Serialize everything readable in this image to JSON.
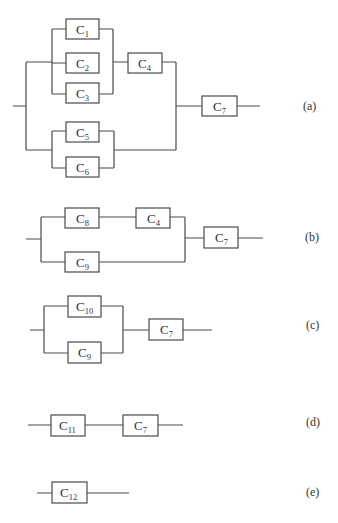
{
  "diagram": {
    "type": "reliability-block-diagram-reduction",
    "colors": {
      "line": "#4a4a4a",
      "text": "#333333",
      "background": "#ffffff"
    },
    "subfigures": [
      {
        "id": "a",
        "label": "(a)",
        "components": [
          {
            "name": "C",
            "sub": "1"
          },
          {
            "name": "C",
            "sub": "2"
          },
          {
            "name": "C",
            "sub": "3"
          },
          {
            "name": "C",
            "sub": "4"
          },
          {
            "name": "C",
            "sub": "5"
          },
          {
            "name": "C",
            "sub": "6"
          },
          {
            "name": "C",
            "sub": "7"
          }
        ],
        "structure": "((C1 || C2 || C3) -> C4) || (C5 || C6), then -> C7"
      },
      {
        "id": "b",
        "label": "(b)",
        "components": [
          {
            "name": "C",
            "sub": "8"
          },
          {
            "name": "C",
            "sub": "4"
          },
          {
            "name": "C",
            "sub": "9"
          },
          {
            "name": "C",
            "sub": "7"
          }
        ],
        "structure": "(C8 -> C4) || C9, then -> C7"
      },
      {
        "id": "c",
        "label": "(c)",
        "components": [
          {
            "name": "C",
            "sub": "10"
          },
          {
            "name": "C",
            "sub": "9"
          },
          {
            "name": "C",
            "sub": "7"
          }
        ],
        "structure": "(C10 || C9) -> C7"
      },
      {
        "id": "d",
        "label": "(d)",
        "components": [
          {
            "name": "C",
            "sub": "11"
          },
          {
            "name": "C",
            "sub": "7"
          }
        ],
        "structure": "C11 -> C7"
      },
      {
        "id": "e",
        "label": "(e)",
        "components": [
          {
            "name": "C",
            "sub": "12"
          }
        ],
        "structure": "C12"
      }
    ]
  }
}
